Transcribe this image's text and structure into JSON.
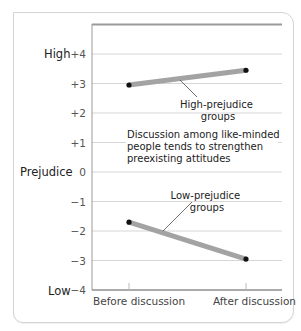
{
  "chart_data": {
    "type": "line",
    "title": "",
    "xlabel": "",
    "ylabel": "Prejudice",
    "categories": [
      "Before discussion",
      "After discussion"
    ],
    "series": [
      {
        "name": "High-prejudice groups",
        "values": [
          2.95,
          3.45
        ]
      },
      {
        "name": "Low-prejudice groups",
        "values": [
          -1.7,
          -2.95
        ]
      }
    ],
    "ylim": [
      -4,
      4
    ],
    "yticks": [
      "+4",
      "+3",
      "+2",
      "+1",
      "0",
      "−1",
      "−2",
      "−3",
      "−4"
    ],
    "ytick_values": [
      4,
      3,
      2,
      1,
      0,
      -1,
      -2,
      -3,
      -4
    ],
    "y_axis_words": {
      "high": "High",
      "middle": "Prejudice",
      "low": "Low"
    },
    "grid": true,
    "legend": "none",
    "annotations": [
      {
        "id": "high_label",
        "lines": [
          "High-prejudice",
          "groups"
        ]
      },
      {
        "id": "low_label",
        "lines": [
          "Low-prejudice",
          "groups"
        ]
      },
      {
        "id": "caption",
        "lines": [
          "Discussion among like-minded",
          "people tends to strengthen",
          "preexisting attitudes"
        ]
      }
    ],
    "colors": {
      "line": "#a3a3a3",
      "marker": "#111111",
      "grid": "#d6d6d6",
      "frame": "#8f8f8f"
    }
  }
}
